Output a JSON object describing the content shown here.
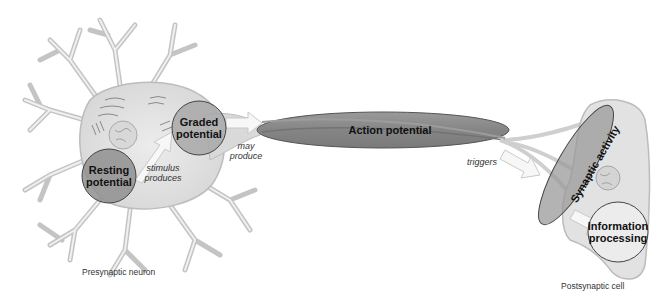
{
  "diagram": {
    "type": "flow",
    "colors": {
      "background": "#ffffff",
      "cell_fill": "#e4e4e4",
      "cell_stroke": "#b9b9b9",
      "resting_circle": "#8d8d8d",
      "graded_circle": "#a6a6a6",
      "action_ellipse": "#8a8a8a",
      "synaptic_ellipse": "#9a9a9a",
      "info_circle": "#ececec",
      "arrow": "#f6f6f6"
    },
    "nodes": {
      "resting": {
        "line1": "Resting",
        "line2": "potential"
      },
      "graded": {
        "line1": "Graded",
        "line2": "potential"
      },
      "action": {
        "label": "Action potential"
      },
      "synaptic": {
        "label": "Synaptic activity"
      },
      "info": {
        "line1": "Information",
        "line2": "processing"
      }
    },
    "edges": {
      "stimulus": {
        "line1": "stimulus",
        "line2": "produces"
      },
      "may_produce": {
        "line1": "may",
        "line2": "produce"
      },
      "triggers": {
        "label": "triggers"
      }
    },
    "captions": {
      "presynaptic": "Presynaptic neuron",
      "postsynaptic": "Postsynaptic cell"
    }
  }
}
